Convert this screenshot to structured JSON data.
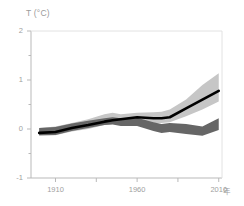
{
  "chart_data": {
    "type": "line",
    "title": "",
    "ylabel": "T (°C)",
    "xlabel": "年",
    "xlim": [
      1895,
      2012
    ],
    "ylim": [
      -1,
      2
    ],
    "grid": false,
    "legend": "none",
    "y_ticks": [
      {
        "value": 2,
        "label": "2"
      },
      {
        "value": 1,
        "label": "1"
      },
      {
        "value": 0,
        "label": "0"
      },
      {
        "value": -1,
        "label": "-1"
      }
    ],
    "y_minor_ticks": [
      1.5,
      0.5,
      -0.5
    ],
    "x_ticks": [
      {
        "value": 1910,
        "label": "1910"
      },
      {
        "value": 1935,
        "label": ""
      },
      {
        "value": 1960,
        "label": "1960"
      },
      {
        "value": 1985,
        "label": ""
      },
      {
        "value": 2010,
        "label": "2010"
      }
    ],
    "x_unit_label": "年",
    "x": [
      1900,
      1910,
      1920,
      1930,
      1940,
      1945,
      1950,
      1960,
      1970,
      1975,
      1980,
      1990,
      2000,
      2010
    ],
    "series": [
      {
        "name": "observed",
        "type": "line",
        "color": "#000000",
        "width": 2.6,
        "values": [
          -0.08,
          -0.06,
          0.02,
          0.08,
          0.15,
          0.18,
          0.2,
          0.24,
          0.22,
          0.22,
          0.24,
          0.42,
          0.6,
          0.78
        ]
      },
      {
        "name": "natural-and-anthropogenic-band",
        "type": "band",
        "color": "#c6c6c6",
        "opacity": 1,
        "upper": [
          0.02,
          0.05,
          0.12,
          0.2,
          0.3,
          0.33,
          0.3,
          0.33,
          0.34,
          0.35,
          0.4,
          0.6,
          0.9,
          1.14
        ],
        "lower": [
          -0.14,
          -0.13,
          -0.05,
          0.0,
          0.08,
          0.1,
          0.1,
          0.14,
          0.12,
          0.12,
          0.14,
          0.26,
          0.4,
          0.56
        ]
      },
      {
        "name": "natural-only-band",
        "type": "band",
        "color": "#666666",
        "opacity": 1,
        "upper": [
          0.02,
          0.04,
          0.11,
          0.17,
          0.22,
          0.24,
          0.22,
          0.23,
          0.14,
          0.1,
          0.12,
          0.1,
          0.05,
          0.22
        ],
        "lower": [
          -0.13,
          -0.12,
          -0.04,
          0.02,
          0.08,
          0.09,
          0.06,
          0.06,
          -0.04,
          -0.08,
          -0.06,
          -0.1,
          -0.14,
          -0.02
        ]
      }
    ]
  },
  "axes": {
    "frame_color": "#b9b9b9",
    "tick_color": "#b9b9b9"
  }
}
